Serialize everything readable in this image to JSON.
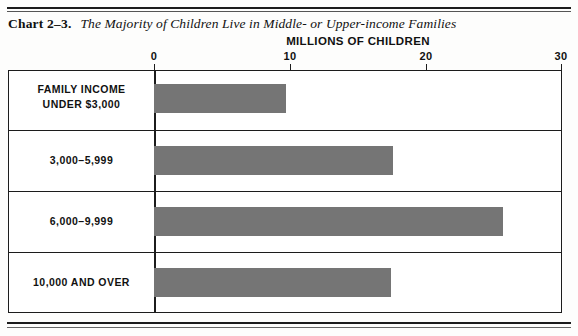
{
  "title": {
    "chart_number": "Chart 2–3.",
    "caption": "The Majority of Children Live in Middle- or Upper-income Families"
  },
  "chart_data": {
    "type": "bar",
    "orientation": "horizontal",
    "title": "The Majority of Children Live in Middle- or Upper-income Families",
    "xlabel": "MILLIONS OF CHILDREN",
    "ylabel": "FAMILY INCOME",
    "xlim": [
      0,
      30
    ],
    "xticks": [
      0,
      10,
      20,
      30
    ],
    "xtick_labels": [
      "0",
      "10",
      "20",
      "30"
    ],
    "grid": false,
    "legend": "none",
    "bar_color": "#757575",
    "categories": [
      "FAMILY INCOME UNDER $3,000",
      "3,000–5,999",
      "6,000–9,999",
      "10,000 AND OVER"
    ],
    "values": [
      9.7,
      17.6,
      25.7,
      17.5
    ]
  },
  "axis": {
    "title": "MILLIONS OF CHILDREN",
    "ticks": [
      {
        "label": "0",
        "value": 0
      },
      {
        "label": "10",
        "value": 10
      },
      {
        "label": "20",
        "value": 20
      },
      {
        "label": "30",
        "value": 30
      }
    ]
  },
  "rows": [
    {
      "label_line1": "FAMILY INCOME",
      "label_line2": "UNDER $3,000",
      "value": 9.7
    },
    {
      "label_line1": "3,000–5,999",
      "label_line2": "",
      "value": 17.6
    },
    {
      "label_line1": "6,000–9,999",
      "label_line2": "",
      "value": 25.7
    },
    {
      "label_line1": "10,000 AND OVER",
      "label_line2": "",
      "value": 17.5
    }
  ]
}
